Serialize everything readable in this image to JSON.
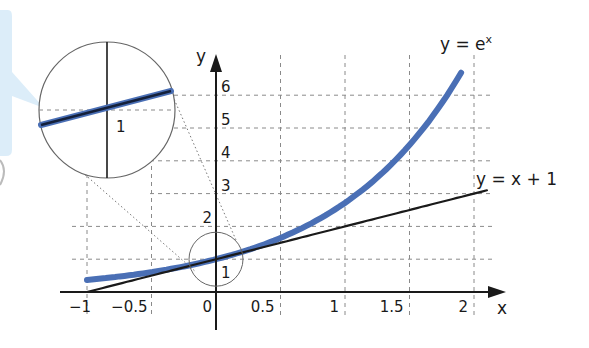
{
  "chart_data": {
    "type": "line",
    "title": "",
    "xlabel": "x",
    "ylabel": "y",
    "xlim": [
      -1,
      2
    ],
    "ylim": [
      0,
      6
    ],
    "grid": true,
    "x_ticks": [
      {
        "value": -1,
        "label": "−1"
      },
      {
        "value": -0.5,
        "label": "−0.5"
      },
      {
        "value": 0,
        "label": "0"
      },
      {
        "value": 0.5,
        "label": "0.5"
      },
      {
        "value": 1,
        "label": "1"
      },
      {
        "value": 1.5,
        "label": "1.5"
      },
      {
        "value": 2,
        "label": "2"
      }
    ],
    "y_ticks": [
      {
        "value": 1,
        "label": "1"
      },
      {
        "value": 2,
        "label": "2"
      },
      {
        "value": 3,
        "label": "3"
      },
      {
        "value": 4,
        "label": "4"
      },
      {
        "value": 5,
        "label": "5"
      },
      {
        "value": 6,
        "label": "6"
      }
    ],
    "series": [
      {
        "name": "y = e^x",
        "label": "y = e",
        "label_sup": "x",
        "color": "#4a6fb5",
        "function": "exp",
        "x_range": [
          -1,
          1.9
        ],
        "sample_points": [
          [
            -1,
            0.37
          ],
          [
            -0.5,
            0.61
          ],
          [
            0,
            1
          ],
          [
            0.5,
            1.65
          ],
          [
            1,
            2.72
          ],
          [
            1.5,
            4.48
          ],
          [
            1.9,
            6.69
          ]
        ]
      },
      {
        "name": "y = x + 1",
        "label": "y = x + 1",
        "color": "#1a1a1a",
        "function": "linear",
        "x_range": [
          -1,
          2.1
        ],
        "sample_points": [
          [
            -1,
            0
          ],
          [
            0,
            1
          ],
          [
            1,
            2
          ],
          [
            2,
            3
          ],
          [
            2.1,
            3.1
          ]
        ]
      }
    ],
    "annotations": [
      {
        "type": "magnifier",
        "center": [
          0,
          1
        ],
        "text": "1",
        "description": "zoomed view of the tangent point (0, 1)"
      }
    ]
  },
  "axes": {
    "x_label": "x",
    "y_label": "y"
  },
  "magnifier": {
    "label": "1"
  },
  "colors": {
    "exp_curve": "#4a6fb5",
    "tangent": "#1a1a1a",
    "callout": "#d6eaf8"
  }
}
